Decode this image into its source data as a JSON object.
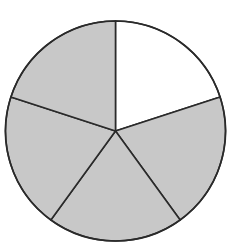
{
  "chart_data": {
    "type": "pie",
    "title": "",
    "categories": [
      "Slice 1",
      "Slice 2",
      "Slice 3",
      "Slice 4",
      "Slice 5"
    ],
    "values": [
      1,
      1,
      1,
      1,
      1
    ],
    "fractions": [
      "1/5",
      "1/5",
      "1/5",
      "1/5",
      "1/5"
    ],
    "shaded": [
      false,
      true,
      true,
      true,
      true
    ],
    "shaded_count": 4,
    "total_parts": 5,
    "start_angle_deg": 0,
    "direction": "clockwise from top",
    "colors": {
      "shaded": "#c8c8c8",
      "unshaded": "#ffffff",
      "stroke": "#2a2a2a"
    },
    "legend": "none",
    "labels_shown": false
  }
}
